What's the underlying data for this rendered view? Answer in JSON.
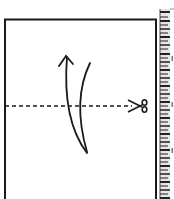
{
  "diagram": {
    "type": "paper-fold-cut-instruction",
    "paper": {
      "shape": "rectangle",
      "stroke": "#1a1a1a"
    },
    "cut_line": {
      "style": "dashed",
      "orientation": "horizontal",
      "tool": "scissors-icon"
    },
    "fold_arrow": {
      "direction": "up",
      "style": "curved"
    },
    "ruler": {
      "position": "right",
      "labels": [
        "",
        "",
        ""
      ]
    }
  }
}
